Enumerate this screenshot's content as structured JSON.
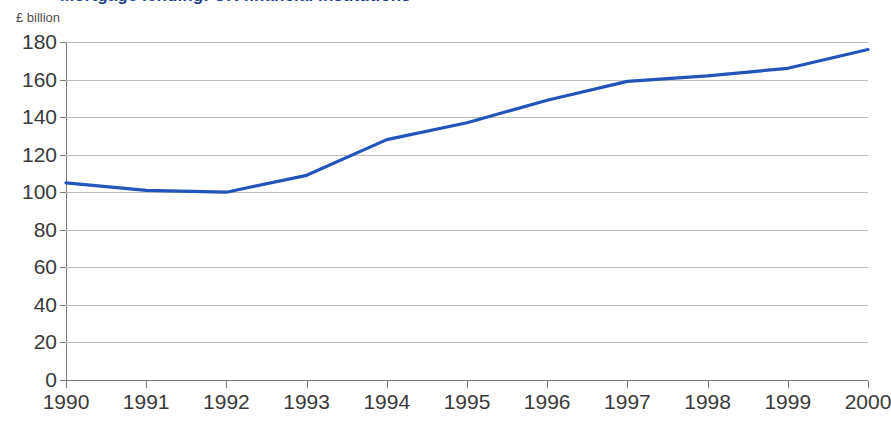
{
  "title": {
    "text": "Mortgage lending: UK financial institutions",
    "color": "#1d3f8c",
    "clipped": true
  },
  "unit_label": "£ billion",
  "chart_data": {
    "type": "line",
    "title": "",
    "xlabel": "",
    "ylabel": "£ billion",
    "grid": true,
    "legend": "none",
    "xlim": [
      1990,
      2000
    ],
    "ylim": [
      0,
      180
    ],
    "ytick_step": 20,
    "x": [
      1990,
      1991,
      1992,
      1993,
      1994,
      1995,
      1996,
      1997,
      1998,
      1999,
      2000
    ],
    "xtick_labels": [
      "1990",
      "1991",
      "1992",
      "1993",
      "1994",
      "1995",
      "1996",
      "1997",
      "1998",
      "1999",
      "2000"
    ],
    "ytick_labels": [
      "0",
      "20",
      "40",
      "60",
      "80",
      "100",
      "120",
      "140",
      "160",
      "180"
    ],
    "ytick_values": [
      0,
      20,
      40,
      60,
      80,
      100,
      120,
      140,
      160,
      180
    ],
    "series": [
      {
        "name": "£ billion",
        "color": "#2255bb",
        "line_width": 3.2,
        "values": [
          105,
          101,
          100,
          109,
          128,
          137,
          149,
          159,
          162,
          166,
          176
        ]
      }
    ]
  },
  "colors": {
    "line": "#2255bb",
    "grid": "#bdbdbd",
    "axis": "#7a7a7a",
    "tick_text": "#3a3a3a",
    "unit_text": "#4d4d4d",
    "background": "#ffffff"
  }
}
